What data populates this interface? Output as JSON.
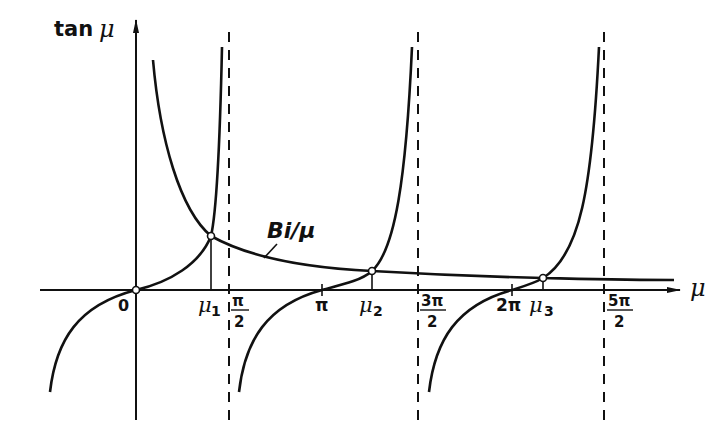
{
  "diagram": {
    "y_axis_label_text": "tan",
    "y_axis_label_symbol": "μ",
    "x_axis_label": "μ",
    "curve_label": "Bi/μ",
    "ticks": [
      {
        "id": "zero",
        "label": "0"
      },
      {
        "id": "mu1",
        "label": "μ",
        "sub": "1"
      },
      {
        "id": "pi_half",
        "num": "π",
        "den": "2"
      },
      {
        "id": "pi",
        "label": "π"
      },
      {
        "id": "mu2",
        "label": "μ",
        "sub": "2"
      },
      {
        "id": "three_pi_half",
        "num": "3π",
        "den": "2"
      },
      {
        "id": "two_pi",
        "label": "2π"
      },
      {
        "id": "mu3",
        "label": "μ",
        "sub": "3"
      },
      {
        "id": "five_pi_half",
        "num": "5π",
        "den": "2"
      }
    ],
    "asymptotes": [
      "π/2",
      "3π/2",
      "5π/2"
    ],
    "intersections": [
      "μ1",
      "μ2",
      "μ3"
    ],
    "colors": {
      "line": "#111111",
      "background": "#ffffff"
    }
  }
}
